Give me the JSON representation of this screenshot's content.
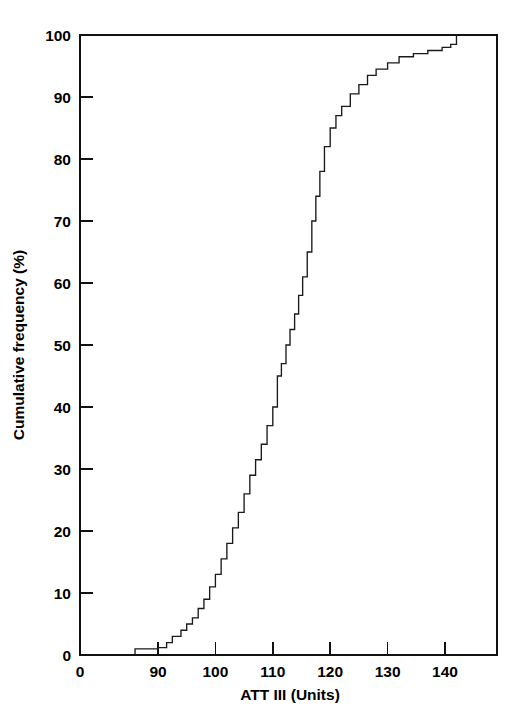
{
  "chart_data": {
    "type": "line",
    "subtype": "cumulative-step",
    "title": "",
    "xlabel": "ATT III (Units)",
    "ylabel": "Cumulative frequency (%)",
    "xlim": [
      84,
      150
    ],
    "ylim": [
      0,
      100
    ],
    "grid": false,
    "legend": null,
    "x_ticks": [
      0,
      90,
      100,
      110,
      120,
      130,
      140
    ],
    "x_tick_labels": [
      "0",
      "90",
      "100",
      "110",
      "120",
      "130",
      "140"
    ],
    "x_axis_break_at_origin": true,
    "y_ticks": [
      0,
      10,
      20,
      30,
      40,
      50,
      60,
      70,
      80,
      90,
      100
    ],
    "y_tick_labels": [
      "0",
      "10",
      "20",
      "30",
      "40",
      "50",
      "60",
      "70",
      "80",
      "90",
      "100"
    ],
    "series": [
      {
        "name": "Cumulative frequency",
        "x": [
          86.0,
          87.5,
          90.0,
          91.5,
          92.5,
          94.0,
          95.0,
          96.0,
          97.0,
          98.0,
          99.0,
          100.0,
          101.0,
          102.0,
          103.0,
          104.0,
          105.0,
          106.0,
          107.0,
          108.0,
          109.0,
          110.0,
          110.8,
          111.5,
          112.3,
          113.0,
          113.8,
          114.5,
          115.2,
          116.0,
          116.8,
          117.5,
          118.2,
          119.0,
          120.0,
          121.0,
          122.0,
          123.5,
          125.0,
          126.5,
          128.0,
          130.0,
          132.0,
          134.5,
          137.0,
          139.5,
          141.0,
          142.0
        ],
        "y": [
          1.0,
          1.0,
          1.2,
          2.0,
          3.0,
          4.0,
          5.0,
          6.0,
          7.5,
          9.0,
          11.0,
          13.0,
          15.5,
          18.0,
          20.5,
          23.0,
          26.0,
          29.0,
          31.5,
          34.0,
          37.0,
          40.0,
          45.0,
          47.0,
          50.0,
          52.5,
          55.0,
          58.0,
          61.0,
          65.0,
          70.0,
          74.0,
          78.0,
          82.0,
          85.0,
          87.0,
          88.5,
          90.5,
          92.0,
          93.5,
          94.5,
          95.5,
          96.5,
          97.0,
          97.5,
          98.0,
          98.5,
          100.0
        ]
      }
    ],
    "notes": {
      "start_value": 86,
      "end_value": 142,
      "median_x": 112.3,
      "description": "Cumulative frequency step distribution of ATT III units rising from 0% near 86 units to 100% at about 142 units."
    }
  },
  "axis": {
    "x_title": "ATT III (Units)",
    "y_title": "Cumulative frequency (%)"
  }
}
